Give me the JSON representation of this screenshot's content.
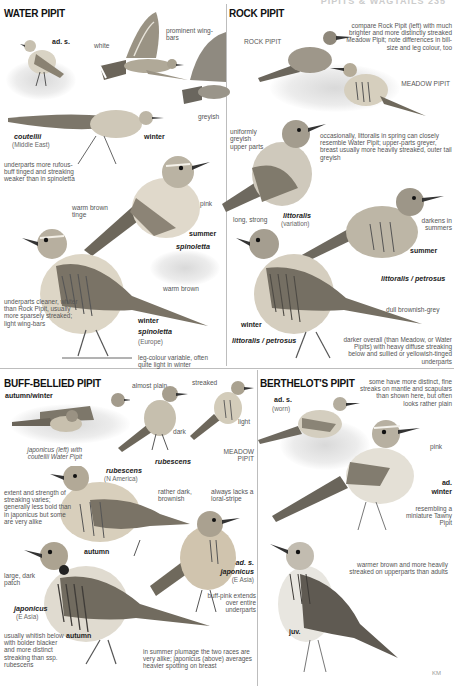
{
  "page_header": "PIPITS & WAGTAILS 235",
  "sections": {
    "water_pipit": {
      "title": "WATER PIPIT",
      "labels": {
        "ad_s": "ad. s.",
        "white": "white",
        "prominent_wing_bars": "prominent wing-bars",
        "greyish": "greyish",
        "coutellii": "coutellii",
        "middle_east": "(Middle East)",
        "winter_1": "winter",
        "underparts_note": "underparts more rufous-buff tinged and streaking weaker than in spinoletta",
        "warm_brown_tinge": "warm brown tinge",
        "pink": "pink",
        "summer": "summer",
        "spinoletta_1": "spinoletta",
        "warm_brown": "warm brown",
        "underparts_cleaner": "underparts cleaner, whiter than Rock Pipit, usually more sparsely streaked; light wing-bars",
        "winter_2": "winter",
        "spinoletta_2": "spinoletta",
        "europe": "(Europe)",
        "leg_colour": "leg-colour variable, often quite light in winter"
      }
    },
    "rock_pipit": {
      "title": "ROCK PIPIT",
      "labels": {
        "rock_pipit_tag": "ROCK PIPIT",
        "compare_note": "compare Rock Pipit (left) with much brighter and more distinctly streaked Meadow Pipit; note differences in bill-size and leg colour, too",
        "meadow_pipit": "MEADOW PIPIT",
        "uniformly_greyish": "uniformly greyish upper parts",
        "occasionally_note": "occasionally, littoralis in spring can closely resemble Water Pipit; upper-parts greyer, breast usually more heavily streaked, outer tail greyish",
        "long_strong": "long, strong",
        "littoralis": "littoralis",
        "variation": "(variation)",
        "darkens": "darkens in summers",
        "summer": "summer",
        "littoralis_petrosus_1": "littoralis / petrosus",
        "dull_brownish_grey": "dull brownish-grey",
        "winter": "winter",
        "littoralis_petrosus_2": "littoralis / petrosus",
        "darker_note": "darker overall (than Meadow, or Water Pipits) with heavy diffuse streaking below and sullied or yellowish-tinged underparts"
      }
    },
    "buff_bellied_pipit": {
      "title": "BUFF-BELLIED PIPIT",
      "labels": {
        "autumn_winter": "autumn/winter",
        "japonicus_note": "japonicus (left) with coutellii Water Pipit",
        "almost_plain": "almost plain",
        "dark": "dark",
        "rubescens_1": "rubescens",
        "streaked": "streaked",
        "light": "light",
        "meadow_pipit": "MEADOW PIPIT",
        "rubescens_2": "rubescens",
        "n_america": "(N America)",
        "extent_note": "extent and strength of streaking varies; generally less bold than in japonicus but some are very alike",
        "rather_dark": "rather dark, brownish",
        "always_lacks": "always lacks a loral-stripe",
        "autumn_1": "autumn",
        "large_dark_patch": "large, dark patch",
        "ad_s": "ad. s.",
        "japonicus_1": "japonicus",
        "e_asia_1": "(E Asia)",
        "buff_pink": "buff-pink extends over entire underparts",
        "japonicus_2": "japonicus",
        "e_asia_2": "(E Asia)",
        "usually_whitish": "usually whitish below with bolder blacker and more distinct streaking than ssp. rubescens",
        "autumn_2": "autumn",
        "summer_note": "in summer plumage the two races are very alike; japonicus (above) averages heavier spotting on breast"
      }
    },
    "berthelots_pipit": {
      "title": "BERTHELOT'S PIPIT",
      "labels": {
        "some_have": "some have more distinct, fine streaks on mantle and scapulars than shown here, but often looks rather plain",
        "ad_s": "ad. s.",
        "worn": "(worn)",
        "pink": "pink",
        "ad_winter_1": "ad.",
        "ad_winter_2": "winter",
        "resembling": "resembling a miniature Tawny Pipit",
        "warmer_note": "warmer brown and more heavily streaked on upperparts than adults",
        "juv": "juv."
      }
    }
  },
  "credit": "KM",
  "colors": {
    "background": "#ffffff",
    "title": "#111111",
    "label": "#555555",
    "divider": "#bdbdbd"
  }
}
